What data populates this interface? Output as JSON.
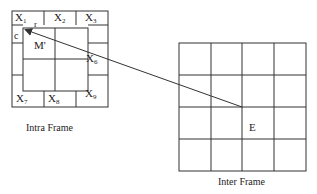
{
  "intra_frame": {
    "caption": "Intra Frame",
    "neighbors": [
      {
        "base": "X",
        "sub": "1"
      },
      {
        "base": "X",
        "sub": "2"
      },
      {
        "base": "X",
        "sub": "3"
      },
      {
        "base": "X",
        "sub": "6"
      },
      {
        "base": "X",
        "sub": "7"
      },
      {
        "base": "X",
        "sub": "8"
      },
      {
        "base": "X",
        "sub": "9"
      }
    ],
    "block_label": "M'",
    "r_label": "r",
    "c_label": "c"
  },
  "inter_frame": {
    "caption": "Inter Frame",
    "block_label": "E",
    "grid": {
      "rows": 4,
      "cols": 4
    }
  },
  "colors": {
    "line": "#333333",
    "background": "#ffffff"
  }
}
